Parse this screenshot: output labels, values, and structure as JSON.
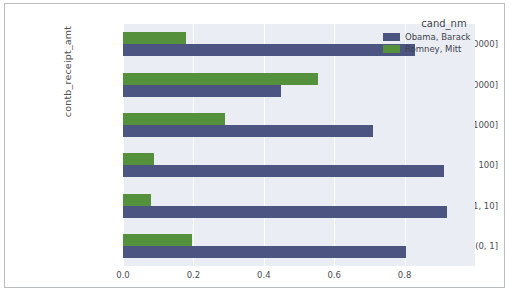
{
  "chart_data": {
    "type": "bar",
    "orientation": "horizontal",
    "title": "",
    "xlabel": "",
    "ylabel": "contb_receipt_amt",
    "categories": [
      "(0, 1]",
      "(1, 10]",
      "(10, 100]",
      "(100, 1000]",
      "(1000, 10000]",
      "(10000, 100000]"
    ],
    "category_order_top_to_bottom": [
      "(10000, 100000]",
      "(1000, 10000]",
      "(100, 1000]",
      "(10, 100]",
      "(1, 10]",
      "(0, 1]"
    ],
    "series": [
      {
        "name": "Obama, Barack",
        "color": "#4c5482",
        "values": [
          0.805,
          0.92,
          0.912,
          0.71,
          0.45,
          0.83
        ]
      },
      {
        "name": "Romney, Mitt",
        "color": "#55903c",
        "values": [
          0.195,
          0.08,
          0.088,
          0.29,
          0.555,
          0.18
        ]
      }
    ],
    "xticks": [
      "0.0",
      "0.2",
      "0.4",
      "0.6",
      "0.8"
    ],
    "xtick_values": [
      0.0,
      0.2,
      0.4,
      0.6,
      0.8
    ],
    "xlim": [
      0.0,
      1.0
    ],
    "grid": true,
    "legend": {
      "title": "cand_nm",
      "position": "upper right",
      "entries": [
        "Obama, Barack",
        "Romney, Mitt"
      ]
    },
    "plot_background": "#eaeef4",
    "gridline_color": "#ffffff"
  },
  "legend": {
    "title": "cand_nm",
    "items": [
      {
        "label": "Obama, Barack",
        "color": "#4c5482"
      },
      {
        "label": "Romney, Mitt",
        "color": "#55903c"
      }
    ]
  },
  "axes": {
    "y_title": "contb_receipt_amt",
    "y_ticks": [
      "(10000, 100000]",
      "(1000, 10000]",
      "(100, 1000]",
      "(10, 100]",
      "(1, 10]",
      "(0, 1]"
    ],
    "x_ticks": [
      "0.0",
      "0.2",
      "0.4",
      "0.6",
      "0.8"
    ]
  }
}
